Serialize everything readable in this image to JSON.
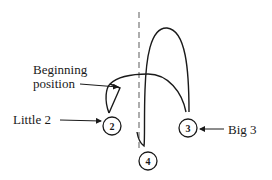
{
  "diagram": {
    "type": "conducting-pattern",
    "beats": [
      {
        "label": "2",
        "name": "Little 2",
        "cx": 112,
        "cy": 125
      },
      {
        "label": "3",
        "name": "Big 3",
        "cx": 188,
        "cy": 128
      },
      {
        "label": "4",
        "name": "",
        "cx": 148,
        "cy": 160
      }
    ],
    "labels": {
      "beginning_line1": "Beginning",
      "beginning_line2": "position",
      "little2": "Little 2",
      "big3": "Big 3"
    },
    "colors": {
      "stroke": "#1a1a1a",
      "dashed": "#777777",
      "background": "#ffffff"
    }
  }
}
